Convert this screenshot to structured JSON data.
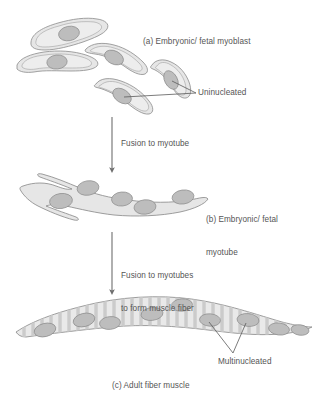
{
  "figure": {
    "title_absent": true,
    "background_color": "#ffffff",
    "labels": {
      "panel_a": "(a) Embryonic/ fetal myoblast",
      "uninucleated": "Uninucleated",
      "fusion_to_myotube": "Fusion to myotube",
      "panel_b_line1": "(b) Embryonic/ fetal",
      "panel_b_line2": "myotube",
      "fusion_to_myotubes_line1": "Fusion to myotubes",
      "fusion_to_myotubes_line2": "to form muscle fiber",
      "multinucleated": "Multinucleated",
      "panel_c": "(c) Adult fiber muscle"
    },
    "colors": {
      "cell_fill": "#e6e6e6",
      "cell_inner_fill": "#ededed",
      "cell_outline": "#8c8c8c",
      "nucleus_fill": "#bdbdbd",
      "nucleus_outline": "#8a8a8a",
      "striation": "#cfcfcf",
      "text": "#555555",
      "arrow": "#6e6e6e",
      "leader_line": "#5a5a5a"
    },
    "stages": [
      {
        "id": "myoblasts",
        "name": "embryonic-fetal-myoblast",
        "label": "(a) Embryonic/ fetal myoblast",
        "cell_count": 5,
        "nuclei_per_cell": 1,
        "annotation": "Uninucleated"
      },
      {
        "id": "myotube",
        "name": "embryonic-fetal-myotube",
        "label": "(b) Embryonic/ fetal myotube",
        "cell_count": 1,
        "nuclei_per_cell": 5,
        "annotation": ""
      },
      {
        "id": "adult-fiber",
        "name": "adult-fiber-muscle",
        "label": "(c) Adult fiber muscle",
        "cell_count": 1,
        "nuclei_per_cell": 9,
        "striated": true,
        "annotation": "Multinucleated"
      }
    ],
    "transitions": [
      {
        "id": "transition-1",
        "text": "Fusion to myotube"
      },
      {
        "id": "transition-2",
        "text": "Fusion to myotubes to form muscle fiber"
      }
    ],
    "icons": {
      "arrow_down": "arrow-down-icon",
      "leader": "leader-line-icon"
    }
  }
}
